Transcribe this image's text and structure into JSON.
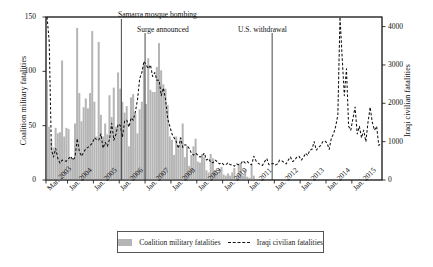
{
  "chart_data": {
    "type": "bar",
    "title": "",
    "xlabel": "",
    "ylabel": "Coalition military fatalities",
    "ylabel_right": "Iraqi civilian fatalities",
    "ylim": [
      0,
      150
    ],
    "ylim_right": [
      0,
      4250
    ],
    "grid": false,
    "legend_position": "bottom",
    "x_start": "Mar. 2003",
    "x_end": "Dec. 2015",
    "x_tick_labels": [
      "Mar. 2003",
      "Jan. 2004",
      "Jan. 2005",
      "Jan. 2006",
      "Jan. 2007",
      "Jan. 2008",
      "Jan. 2009",
      "Jan. 2010",
      "Jan. 2011",
      "Jan. 2012",
      "Jan. 2013",
      "Jan. 2014",
      "Jan. 2015"
    ],
    "y_tick_labels_left": [
      "0",
      "50",
      "100",
      "150"
    ],
    "y_tick_values_left": [
      0,
      50,
      100,
      150
    ],
    "y_tick_labels_right": [
      "0",
      "1000",
      "2000",
      "3000",
      "4000"
    ],
    "y_tick_values_right": [
      0,
      1000,
      2000,
      3000,
      4000
    ],
    "annotations": [
      {
        "label": "Samarra mosque bombing",
        "x_month": "Feb. 2006"
      },
      {
        "label": "Surge announced",
        "x_month": "Jan. 2007"
      },
      {
        "label": "U.S. withdrawal",
        "x_month": "Dec. 2011"
      }
    ],
    "series": [
      {
        "name": "Coalition military fatalities",
        "type": "bar",
        "axis": "left",
        "color": "#b5b5b5",
        "values": [
          92,
          49,
          37,
          30,
          48,
          43,
          44,
          110,
          40,
          48,
          47,
          21,
          20,
          52,
          140,
          80,
          54,
          67,
          75,
          66,
          80,
          137,
          72,
          40,
          127,
          60,
          40,
          52,
          42,
          78,
          58,
          85,
          49,
          99,
          84,
          72,
          62,
          68,
          31,
          76,
          79,
          61,
          43,
          65,
          72,
          106,
          70,
          112,
          83,
          81,
          81,
          104,
          126,
          101,
          88,
          84,
          69,
          40,
          37,
          23,
          40,
          29,
          39,
          52,
          21,
          31,
          13,
          23,
          31,
          38,
          17,
          16,
          24,
          21,
          9,
          7,
          24,
          20,
          9,
          7,
          10,
          12,
          5,
          4,
          6,
          4,
          7,
          11,
          2,
          15,
          15,
          4,
          9,
          3,
          2,
          14,
          4,
          1,
          0,
          0,
          0,
          0,
          0,
          0,
          0,
          0,
          0,
          0,
          0,
          0,
          0,
          0,
          0,
          0,
          0,
          0,
          0,
          0,
          0,
          0,
          0,
          0,
          0,
          0,
          0,
          0,
          0,
          0,
          0,
          0,
          0,
          0,
          0,
          0,
          0,
          0,
          0,
          0,
          0,
          0,
          0,
          0,
          0,
          0,
          0,
          0,
          0,
          0,
          0,
          0,
          0,
          0,
          0,
          0,
          0,
          0
        ]
      },
      {
        "name": "Iraqi civilian fatalities",
        "type": "line",
        "style": "dashed",
        "axis": "right",
        "color": "#111111",
        "values": [
          4250,
          3600,
          800,
          600,
          820,
          560,
          440,
          520,
          500,
          490,
          560,
          620,
          520,
          600,
          1080,
          740,
          620,
          720,
          820,
          850,
          900,
          960,
          1100,
          1050,
          1040,
          1200,
          830,
          980,
          880,
          1060,
          1480,
          1040,
          1200,
          1460,
          1420,
          1120,
          1540,
          1560,
          1380,
          1620,
          1560,
          1780,
          2100,
          2650,
          2800,
          3100,
          3000,
          2900,
          3000,
          2700,
          2800,
          2600,
          2600,
          2200,
          2400,
          2100,
          1600,
          1400,
          1200,
          1100,
          1000,
          820,
          1100,
          850,
          920,
          900,
          820,
          700,
          650,
          700,
          650,
          600,
          620,
          700,
          520,
          560,
          460,
          450,
          520,
          480,
          420,
          450,
          400,
          400,
          450,
          400,
          400,
          360,
          420,
          400,
          430,
          500,
          440,
          480,
          420,
          400,
          620,
          500,
          440,
          400,
          380,
          480,
          560,
          400,
          420,
          430,
          390,
          420,
          520,
          500,
          460,
          420,
          520,
          600,
          480,
          520,
          600,
          620,
          520,
          580,
          700,
          640,
          780,
          800,
          1000,
          780,
          840,
          900,
          1000,
          1020,
          960,
          800,
          1100,
          1200,
          1400,
          1700,
          4250,
          3200,
          2200,
          2900,
          1400,
          1300,
          1600,
          1900,
          1200,
          1400,
          1100,
          1300,
          1000,
          1500,
          1900,
          1500,
          1300,
          1400,
          900,
          950
        ]
      }
    ]
  },
  "legend": {
    "items": [
      {
        "label": "Coalition military fatalities",
        "marker": "bar-swatch"
      },
      {
        "label": "Iraqi civilian fatalities",
        "marker": "dashed-line"
      }
    ]
  },
  "colors": {
    "bar_fill": "#b5b5b5",
    "line": "#111111",
    "axis": "#222222",
    "annotation_line": "#333333"
  }
}
